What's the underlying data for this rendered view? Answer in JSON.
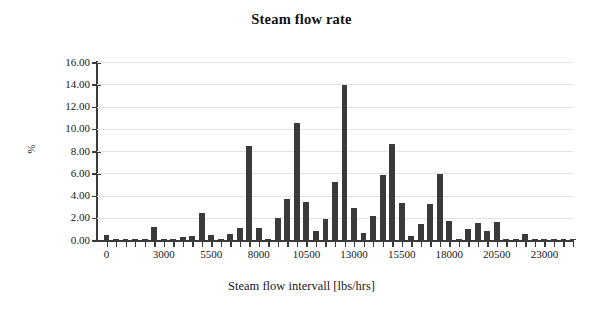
{
  "chart_data": {
    "type": "bar",
    "title": "Steam flow rate",
    "xlabel": "Steam flow intervall [lbs/hrs]",
    "ylabel": "%",
    "grid": true,
    "legend": "none",
    "xlim": [
      -500,
      24500
    ],
    "ylim": [
      0,
      16
    ],
    "ytick_labels": [
      "16.00",
      "14.00",
      "12.00",
      "10.00",
      "8.00",
      "6.00",
      "4.00",
      "2.00",
      "0.00"
    ],
    "ytick_values": [
      16,
      14,
      12,
      10,
      8,
      6,
      4,
      2,
      0
    ],
    "xtick_labels": [
      "0",
      "3000",
      "5500",
      "8000",
      "10500",
      "13000",
      "15500",
      "18000",
      "20500",
      "23000"
    ],
    "xtick_values": [
      0,
      3000,
      5500,
      8000,
      10500,
      13000,
      15500,
      18000,
      20500,
      23000
    ],
    "bin_width": 500,
    "categories": [
      "0",
      "500",
      "1000",
      "1500",
      "2000",
      "2500",
      "3000",
      "3500",
      "4000",
      "4500",
      "5000",
      "5500",
      "6000",
      "6500",
      "7000",
      "7500",
      "8000",
      "8500",
      "9000",
      "9500",
      "10000",
      "10500",
      "11000",
      "11500",
      "12000",
      "12500",
      "13000",
      "13500",
      "14000",
      "14500",
      "15000",
      "15500",
      "16000",
      "16500",
      "17000",
      "17500",
      "18000",
      "18500",
      "19000",
      "19500",
      "20000",
      "20500",
      "21000",
      "21500",
      "22000",
      "22500",
      "23000",
      "23500",
      "24000",
      "24500"
    ],
    "values": [
      0.45,
      0.05,
      0.05,
      0.05,
      0.05,
      1.15,
      0.05,
      0.05,
      0.3,
      0.35,
      2.45,
      0.45,
      0.1,
      0.55,
      1.05,
      8.45,
      1.1,
      0.1,
      2.0,
      3.65,
      10.55,
      3.45,
      0.85,
      1.85,
      5.25,
      13.95,
      2.9,
      0.65,
      2.15,
      5.8,
      8.6,
      3.3,
      0.4,
      1.45,
      3.2,
      5.95,
      1.75,
      0.1,
      0.95,
      1.5,
      0.8,
      1.6,
      0.1,
      0.1,
      0.5,
      0.05,
      0.05,
      0.05,
      0.05,
      0.05
    ],
    "series": [
      {
        "name": "Steam flow rate distribution",
        "values": [
          0.45,
          0.05,
          0.05,
          0.05,
          0.05,
          1.15,
          0.05,
          0.05,
          0.3,
          0.35,
          2.45,
          0.45,
          0.1,
          0.55,
          1.05,
          8.45,
          1.1,
          0.1,
          2.0,
          3.65,
          10.55,
          3.45,
          0.85,
          1.85,
          5.25,
          13.95,
          2.9,
          0.65,
          2.15,
          5.8,
          8.6,
          3.3,
          0.4,
          1.45,
          3.2,
          5.95,
          1.75,
          0.1,
          0.95,
          1.5,
          0.8,
          1.6,
          0.1,
          0.1,
          0.5,
          0.05,
          0.05,
          0.05,
          0.05,
          0.05
        ]
      }
    ],
    "colors": {
      "bar": "#3a3a3a",
      "axis": "#3b3b3b",
      "grid": "#e3e3e3",
      "text": "#171717",
      "background": "#ffffff"
    }
  }
}
